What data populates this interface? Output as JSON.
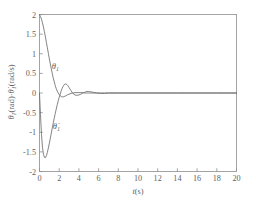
{
  "chart_data": {
    "type": "line",
    "title": "",
    "xlabel": "t(s)",
    "ylabel": "θ₁(rad)·θ̇₁(rad/s)",
    "xlim": [
      0,
      20
    ],
    "ylim": [
      -2,
      2
    ],
    "xticks": [
      0,
      2,
      4,
      6,
      8,
      10,
      12,
      14,
      16,
      18,
      20
    ],
    "yticks": [
      2,
      1.5,
      1,
      0.5,
      0,
      -0.5,
      -1,
      -1.5,
      -2
    ],
    "xtick_labels": [
      "0",
      "2",
      "4",
      "6",
      "8",
      "10",
      "12",
      "14",
      "16",
      "18",
      "20"
    ],
    "ytick_labels": [
      "2",
      "1.5",
      "1",
      "0.5",
      "0",
      "-0.5",
      "-1",
      "-1.5",
      "-2"
    ],
    "grid": false,
    "legend_position": "inline-annotations",
    "annotations": [
      {
        "name": "theta-1-label",
        "text": "θ₁",
        "x": 1.25,
        "y": 0.62
      },
      {
        "name": "theta-dot-1-label",
        "text": "θ̇₁",
        "x": 1.35,
        "y": -0.92
      }
    ],
    "series": [
      {
        "name": "θ₁",
        "unit": "rad",
        "color": "#6e6e6e",
        "x": [
          0,
          0.1,
          0.2,
          0.3,
          0.4,
          0.5,
          0.6,
          0.7,
          0.8,
          0.9,
          1.0,
          1.1,
          1.2,
          1.3,
          1.4,
          1.5,
          1.6,
          1.7,
          1.8,
          1.9,
          2.0,
          2.1,
          2.2,
          2.3,
          2.4,
          2.5,
          2.6,
          2.7,
          2.8,
          2.9,
          3.0,
          3.2,
          3.4,
          3.6,
          3.8,
          4.0,
          4.2,
          4.4,
          4.6,
          4.8,
          5.0,
          5.4,
          5.8,
          6.2,
          6.6,
          7.0,
          8.0,
          9.0,
          10.0,
          12.0,
          14.0,
          16.0,
          18.0,
          20.0
        ],
        "y": [
          2.0,
          1.95,
          1.88,
          1.79,
          1.68,
          1.56,
          1.43,
          1.29,
          1.15,
          1.01,
          0.87,
          0.74,
          0.61,
          0.49,
          0.38,
          0.28,
          0.19,
          0.11,
          0.05,
          0.0,
          -0.04,
          -0.07,
          -0.09,
          -0.1,
          -0.1,
          -0.09,
          -0.08,
          -0.07,
          -0.05,
          -0.04,
          -0.03,
          -0.01,
          0.0,
          0.01,
          0.01,
          0.01,
          0.01,
          0.01,
          0.0,
          0.0,
          0.0,
          0.0,
          0.0,
          0.0,
          0.0,
          0.0,
          0.0,
          0.0,
          0.0,
          0.0,
          0.0,
          0.0,
          0.0,
          0.0
        ]
      },
      {
        "name": "θ̇₁",
        "unit": "rad/s",
        "color": "#6e6e6e",
        "x": [
          0,
          0.1,
          0.2,
          0.3,
          0.4,
          0.5,
          0.6,
          0.7,
          0.8,
          0.9,
          1.0,
          1.1,
          1.2,
          1.3,
          1.4,
          1.5,
          1.6,
          1.7,
          1.8,
          1.9,
          2.0,
          2.1,
          2.2,
          2.3,
          2.4,
          2.5,
          2.6,
          2.7,
          2.8,
          2.9,
          3.0,
          3.1,
          3.2,
          3.3,
          3.4,
          3.5,
          3.6,
          3.8,
          4.0,
          4.2,
          4.4,
          4.6,
          4.8,
          5.0,
          5.2,
          5.4,
          5.8,
          6.2,
          6.6,
          7.0,
          8.0,
          9.0,
          10.0,
          12.0,
          14.0,
          16.0,
          18.0,
          20.0
        ],
        "y": [
          0.0,
          -0.55,
          -1.05,
          -1.38,
          -1.56,
          -1.64,
          -1.65,
          -1.6,
          -1.51,
          -1.4,
          -1.28,
          -1.15,
          -1.02,
          -0.89,
          -0.76,
          -0.64,
          -0.52,
          -0.41,
          -0.3,
          -0.2,
          -0.11,
          -0.03,
          0.05,
          0.12,
          0.17,
          0.21,
          0.23,
          0.23,
          0.21,
          0.18,
          0.14,
          0.1,
          0.06,
          0.02,
          -0.01,
          -0.03,
          -0.05,
          -0.06,
          -0.05,
          -0.03,
          0.0,
          0.02,
          0.04,
          0.04,
          0.03,
          0.02,
          0.0,
          -0.01,
          -0.01,
          0.0,
          0.0,
          0.0,
          0.0,
          0.0,
          0.0,
          0.0,
          0.0,
          0.0
        ]
      }
    ]
  },
  "axis": {
    "x_title_italic": "t",
    "x_title_unit": "(s)"
  },
  "ylabel_parts": {
    "theta": "θ",
    "sub1": "1",
    "rad": "(rad)",
    "sep": "·",
    "thetadot": "θ̇",
    "radps": "(rad/s)"
  }
}
